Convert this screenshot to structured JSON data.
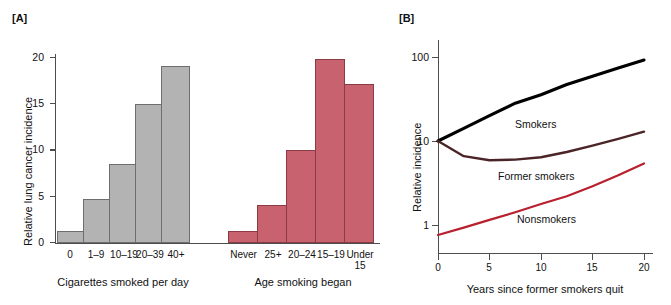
{
  "figure": {
    "panel_a_label": "[A]",
    "panel_b_label": "[B]"
  },
  "panel_a": {
    "ylabel": "Relative lung cancer incidence",
    "y_ticks": [
      "0",
      "5",
      "10",
      "15",
      "20"
    ],
    "groups": [
      {
        "name": "cigarettes-per-day",
        "xlabel": "Cigarettes smoked per day",
        "color": "#b3b3b3",
        "categories": [
          "0",
          "1–9",
          "10–19",
          "20–39",
          "40+"
        ],
        "values": [
          1.2,
          4.7,
          8.5,
          14.9,
          19.0
        ]
      },
      {
        "name": "age-smoking-began",
        "xlabel": "Age smoking began",
        "color": "#c9626f",
        "categories": [
          "Never",
          "25+",
          "20–24",
          "15–19",
          "Under\n15"
        ],
        "categories_line1": [
          "Never",
          "25+",
          "20–24",
          "15–19",
          "Under"
        ],
        "categories_line2": [
          "",
          "",
          "",
          "",
          "15"
        ],
        "values": [
          1.2,
          4.0,
          10.0,
          19.7,
          17.0
        ]
      }
    ]
  },
  "panel_b": {
    "ylabel": "Relative incidence",
    "xlabel": "Years since former smokers quit",
    "y_ticks": [
      "1",
      "10",
      "100"
    ],
    "x_ticks": [
      "0",
      "5",
      "10",
      "15",
      "20"
    ],
    "curve_labels": {
      "smokers": "Smokers",
      "former_smokers": "Former smokers",
      "nonsmokers": "Nonsmokers"
    }
  },
  "chart_data": [
    {
      "type": "bar",
      "title": "[A] Relative lung cancer incidence by smoking exposure",
      "ylabel": "Relative lung cancer incidence",
      "ylim": [
        0,
        21
      ],
      "ytick_values": [
        0,
        5,
        10,
        15,
        20
      ],
      "grid": false,
      "legend": "none",
      "subplots": [
        {
          "name": "Cigarettes smoked per day",
          "xlabel": "Cigarettes smoked per day",
          "color": "#b3b3b3",
          "categories": [
            "0",
            "1–9",
            "10–19",
            "20–39",
            "40+"
          ],
          "values": [
            1.2,
            4.7,
            8.5,
            14.9,
            19.0
          ]
        },
        {
          "name": "Age smoking began",
          "xlabel": "Age smoking began",
          "color": "#c9626f",
          "categories": [
            "Never",
            "25+",
            "20–24",
            "15–19",
            "Under 15"
          ],
          "values": [
            1.2,
            4.0,
            10.0,
            19.7,
            17.0
          ]
        }
      ]
    },
    {
      "type": "line",
      "title": "[B] Relative incidence vs. years since quitting",
      "xlabel": "Years since former smokers quit",
      "ylabel": "Relative incidence",
      "xlim": [
        0,
        21
      ],
      "ylim": [
        0.6,
        130
      ],
      "yscale": "log",
      "ytick_values": [
        1,
        10,
        100
      ],
      "xtick_values": [
        0,
        5,
        10,
        15,
        20
      ],
      "grid": false,
      "legend": "inline-annotations",
      "x": [
        0,
        2.5,
        5,
        7.5,
        10,
        12.5,
        15,
        17.5,
        20
      ],
      "series": [
        {
          "name": "Smokers",
          "color": "#000000",
          "values": [
            10.0,
            14.1,
            20.0,
            28.2,
            35.5,
            47.0,
            59.0,
            74.0,
            92.0
          ]
        },
        {
          "name": "Former smokers",
          "color": "#4a2426",
          "values": [
            10.0,
            6.6,
            5.9,
            6.0,
            6.4,
            7.4,
            8.8,
            10.6,
            12.9
          ]
        },
        {
          "name": "Nonsmokers",
          "color": "#b8202e",
          "values": [
            0.76,
            0.93,
            1.15,
            1.42,
            1.78,
            2.2,
            2.9,
            3.9,
            5.4
          ]
        }
      ],
      "annotations": [
        {
          "text": "Smokers",
          "x": 10.0,
          "y": 33.0
        },
        {
          "text": "Former smokers",
          "x": 9.0,
          "y": 4.3
        },
        {
          "text": "Nonsmokers",
          "x": 11.0,
          "y": 1.35
        }
      ]
    }
  ]
}
